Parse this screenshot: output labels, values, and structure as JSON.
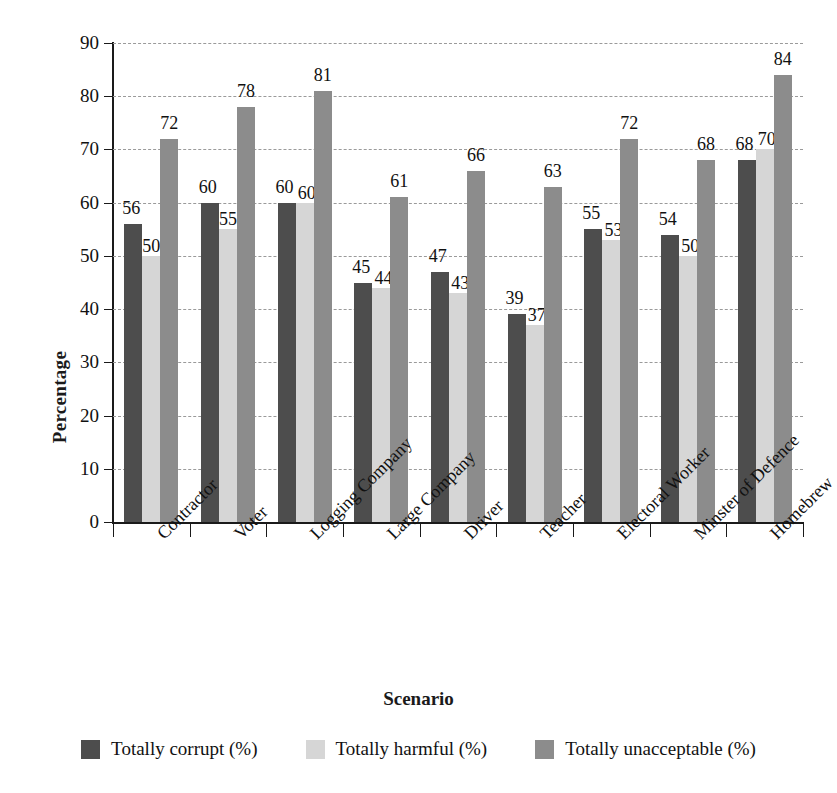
{
  "chart_data": {
    "type": "bar",
    "title": "",
    "xlabel": "Scenario",
    "ylabel": "Percentage",
    "ylim": [
      0,
      90
    ],
    "ytick_step": 10,
    "yticks": [
      0,
      10,
      20,
      30,
      40,
      50,
      60,
      70,
      80,
      90
    ],
    "grid": true,
    "grid_style": "dashed-horizontal",
    "legend_position": "bottom",
    "categories": [
      "Contractor",
      "Voter",
      "Logging Company",
      "Large Company",
      "Driver",
      "Teacher",
      "Electoral Worker",
      "Minster of Defence",
      "Homebrew"
    ],
    "series": [
      {
        "name": "Totally corrupt (%)",
        "color": "#4d4d4d",
        "values": [
          56,
          60,
          60,
          45,
          47,
          39,
          55,
          54,
          68
        ]
      },
      {
        "name": "Totally harmful (%)",
        "color": "#d6d6d6",
        "values": [
          50,
          55,
          60,
          44,
          43,
          37,
          53,
          50,
          70
        ]
      },
      {
        "name": "Totally unacceptable (%)",
        "color": "#8c8c8c",
        "values": [
          72,
          78,
          81,
          61,
          66,
          63,
          72,
          68,
          84
        ]
      }
    ]
  },
  "axes": {
    "y_title": "Percentage",
    "x_title": "Scenario",
    "ytick_labels": [
      "0",
      "10",
      "20",
      "30",
      "40",
      "50",
      "60",
      "70",
      "80",
      "90"
    ]
  },
  "legend": {
    "items": [
      {
        "label": "Totally corrupt (%)",
        "color": "#4d4d4d"
      },
      {
        "label": "Totally harmful (%)",
        "color": "#d6d6d6"
      },
      {
        "label": "Totally unacceptable (%)",
        "color": "#8c8c8c"
      }
    ]
  }
}
